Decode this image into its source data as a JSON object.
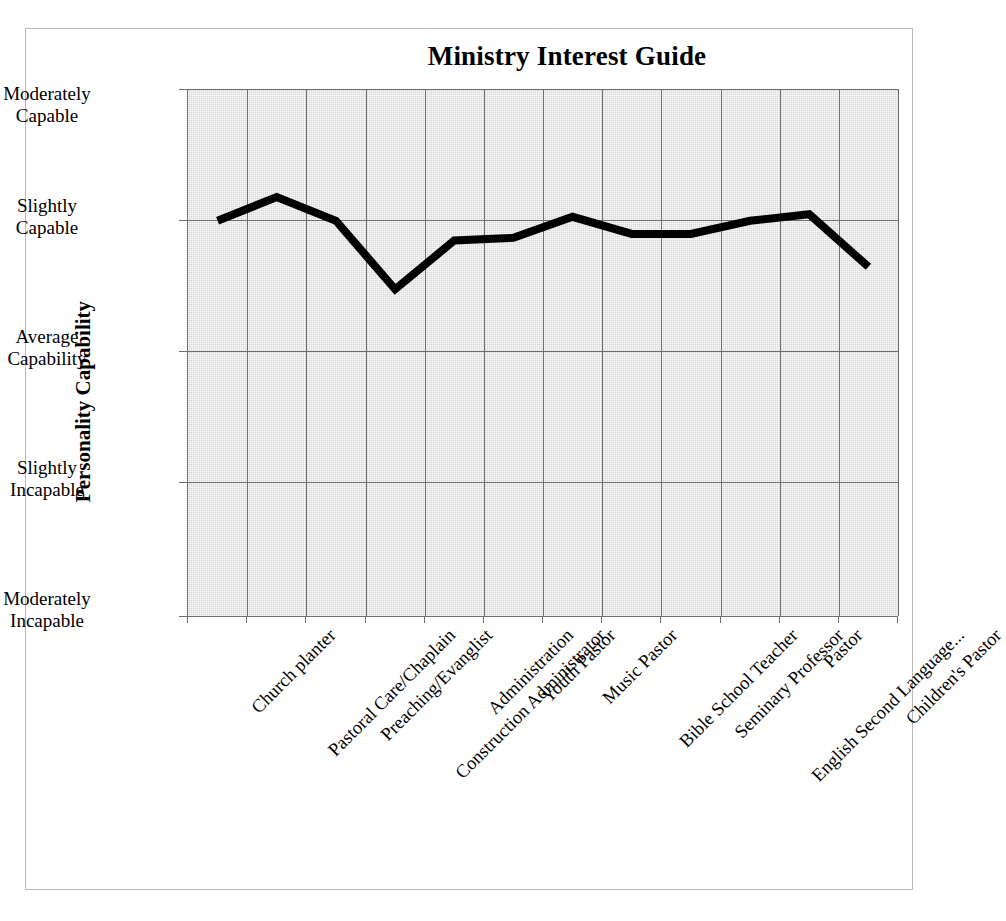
{
  "chart_data": {
    "type": "line",
    "title": "Ministry Interest Guide",
    "xlabel": "",
    "ylabel": "Personality Capability",
    "grid": true,
    "legend": "none",
    "categories": [
      "Church planter",
      "Pastoral Care/Chaplain",
      "Preaching/Evanglist",
      "Construction Administrator",
      "Administration",
      "Youth Pastor",
      "Music Pastor",
      "Bible School Teacher",
      "Seminary Professor",
      "English Second Language...",
      "Pastor",
      "Children's Pastor"
    ],
    "ytick_labels": [
      "Moderately Capable",
      "Slightly Capable",
      "Average Capability",
      "Slightly Incapable",
      "Moderately Incapable"
    ],
    "ytick_values": [
      2,
      1,
      0,
      -1,
      -2
    ],
    "ylim": [
      -2,
      2
    ],
    "values": [
      1.0,
      1.18,
      1.0,
      0.48,
      0.85,
      0.87,
      1.03,
      0.9,
      0.9,
      1.0,
      1.05,
      0.65
    ],
    "series_color": "#000000",
    "plot_background": "#d6d6d6",
    "gridline_color": "#6e6e6e"
  },
  "axis_labels": {
    "y0": "Moderately",
    "y0b": "Capable",
    "y1": "Slightly",
    "y1b": "Capable",
    "y2": "Average",
    "y2b": "Capability",
    "y3": "Slightly",
    "y3b": "Incapable",
    "y4": "Moderately",
    "y4b": "Incapable"
  }
}
